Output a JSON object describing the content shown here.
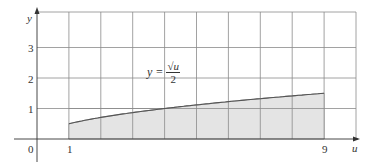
{
  "chart_data": {
    "type": "area",
    "title": "",
    "xlabel": "u",
    "ylabel": "y",
    "function": "y = sqrt(u)/2",
    "annotation": {
      "lhs": "y =",
      "numerator": "√u",
      "denominator": "2"
    },
    "shaded_interval": [
      1,
      9
    ],
    "x": [
      1,
      2,
      3,
      4,
      5,
      6,
      7,
      8,
      9
    ],
    "values": [
      0.5,
      0.707,
      0.866,
      1.0,
      1.118,
      1.225,
      1.323,
      1.414,
      1.5
    ],
    "xlim": [
      0,
      10
    ],
    "ylim": [
      0,
      4
    ],
    "x_ticks": [
      "0",
      "1",
      "9"
    ],
    "y_ticks": [
      "1",
      "2",
      "3"
    ],
    "grid": true,
    "colors": {
      "grid": "#8a8a8a",
      "fill": "#e4e4e4",
      "curve": "#555555",
      "axis": "#333333"
    }
  }
}
